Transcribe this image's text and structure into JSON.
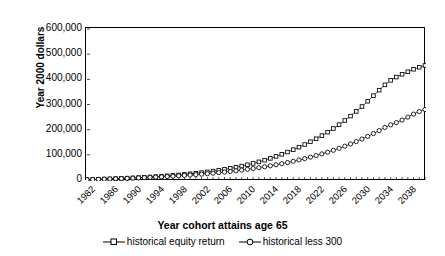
{
  "chart_data": {
    "type": "line",
    "title": "",
    "xlabel": "Year cohort attains age 65",
    "ylabel": "Year 2000 dollars",
    "ylim": [
      0,
      600000
    ],
    "xlim": [
      1982,
      2041
    ],
    "grid": false,
    "legend_position": "bottom",
    "ytick_labels": [
      "600,000",
      "500,000",
      "400,000",
      "300,000",
      "200,000",
      "100,000",
      "0"
    ],
    "ytick_values": [
      600000,
      500000,
      400000,
      300000,
      200000,
      100000,
      0
    ],
    "xtick_labels": [
      "1982",
      "1986",
      "1990",
      "1994",
      "1998",
      "2002",
      "2006",
      "2010",
      "2014",
      "2018",
      "2022",
      "2026",
      "2030",
      "2034",
      "2038"
    ],
    "xtick_values": [
      1982,
      1986,
      1990,
      1994,
      1998,
      2002,
      2006,
      2010,
      2014,
      2018,
      2022,
      2026,
      2030,
      2034,
      2038
    ],
    "x": [
      1982,
      1983,
      1984,
      1985,
      1986,
      1987,
      1988,
      1989,
      1990,
      1991,
      1992,
      1993,
      1994,
      1995,
      1996,
      1997,
      1998,
      1999,
      2000,
      2001,
      2002,
      2003,
      2004,
      2005,
      2006,
      2007,
      2008,
      2009,
      2010,
      2011,
      2012,
      2013,
      2014,
      2015,
      2016,
      2017,
      2018,
      2019,
      2020,
      2021,
      2022,
      2023,
      2024,
      2025,
      2026,
      2027,
      2028,
      2029,
      2030,
      2031,
      2032,
      2033,
      2034,
      2035,
      2036,
      2037,
      2038,
      2039,
      2040,
      2041
    ],
    "series": [
      {
        "name": "historical equity return",
        "marker": "square",
        "values": [
          1500,
          2200,
          3000,
          3800,
          4600,
          5500,
          6400,
          7400,
          8400,
          9500,
          10700,
          12000,
          13400,
          14900,
          16500,
          18300,
          20200,
          22300,
          24500,
          26900,
          29500,
          32300,
          35400,
          38700,
          42300,
          46300,
          50600,
          55300,
          60400,
          66000,
          72100,
          78700,
          85900,
          93700,
          102000,
          111000,
          120500,
          130500,
          141000,
          152000,
          164000,
          176500,
          190000,
          204500,
          220000,
          236500,
          254000,
          272500,
          292000,
          313000,
          335000,
          357000,
          378000,
          396000,
          409000,
          420000,
          430000,
          440000,
          448000,
          455000
        ]
      },
      {
        "name": "historical less 300",
        "marker": "circle",
        "values": [
          1400,
          2000,
          2700,
          3400,
          4100,
          4900,
          5700,
          6500,
          7400,
          8300,
          9300,
          10300,
          11400,
          12600,
          13800,
          15100,
          16500,
          18000,
          19600,
          21300,
          23100,
          25000,
          27000,
          29200,
          31500,
          34000,
          36600,
          39400,
          42400,
          45600,
          49000,
          52600,
          56400,
          60500,
          64800,
          69400,
          74300,
          79500,
          85000,
          90900,
          97100,
          103700,
          110700,
          118100,
          126000,
          134400,
          143300,
          152700,
          162700,
          173300,
          184500,
          196300,
          208800,
          219000,
          228000,
          238000,
          250000,
          262000,
          272000,
          280000
        ]
      }
    ]
  },
  "legend": {
    "entries": [
      {
        "label": "historical equity  return"
      },
      {
        "label": "historical less 300"
      }
    ]
  }
}
